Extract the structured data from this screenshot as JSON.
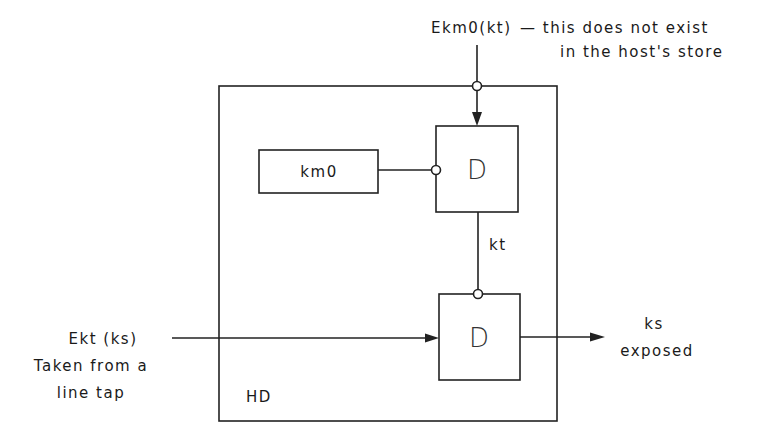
{
  "diagram": {
    "outer_box": {
      "label": "HD"
    },
    "top_input": {
      "label": "Ekm0(kt)",
      "note_line1": "— this does not exist",
      "note_line2": "in the host's store"
    },
    "km0_box": {
      "label": "km0"
    },
    "upper_decrypt": {
      "label": "D"
    },
    "intermediate": {
      "label": "kt"
    },
    "lower_decrypt": {
      "label": "D"
    },
    "left_input": {
      "line1": "Ekt (ks)",
      "line2": "Taken from a",
      "line3": "line tap"
    },
    "output": {
      "line1": "ks",
      "line2": "exposed"
    }
  }
}
